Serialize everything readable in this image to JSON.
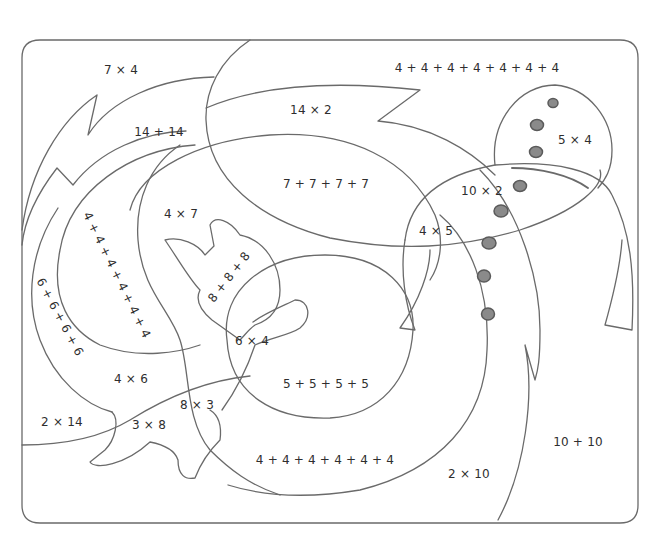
{
  "worksheet": {
    "type": "color-by-number math puzzle",
    "colors": {
      "line": "#6a6a6a",
      "dot_fill": "#8a8a8a",
      "dot_stroke": "#5a5a5a",
      "text": "#2e2e2e",
      "background": "#ffffff"
    },
    "regions": [
      {
        "id": "r1",
        "label": "7 × 4",
        "x": 121,
        "y": 70,
        "rotate": 0
      },
      {
        "id": "r2",
        "label": "4 + 4 + 4 + 4 + 4 + 4 + 4",
        "x": 477,
        "y": 68,
        "rotate": 0
      },
      {
        "id": "r3",
        "label": "14 × 2",
        "x": 311,
        "y": 110,
        "rotate": 0
      },
      {
        "id": "r4",
        "label": "14 + 14",
        "x": 159,
        "y": 132,
        "rotate": 0
      },
      {
        "id": "r5",
        "label": "5 × 4",
        "x": 575,
        "y": 140,
        "rotate": 0
      },
      {
        "id": "r6",
        "label": "7 + 7 + 7 + 7",
        "x": 326,
        "y": 184,
        "rotate": 0
      },
      {
        "id": "r7",
        "label": "10 × 2",
        "x": 482,
        "y": 191,
        "rotate": 0
      },
      {
        "id": "r8",
        "label": "4 × 7",
        "x": 181,
        "y": 214,
        "rotate": 0
      },
      {
        "id": "r9",
        "label": "4 × 5",
        "x": 436,
        "y": 231,
        "rotate": 0
      },
      {
        "id": "r10",
        "label": "4 + 4 + 4 + 4 + 4 + 4",
        "x": 117,
        "y": 275,
        "rotate": 64
      },
      {
        "id": "r11",
        "label": "8 + 8 + 8",
        "x": 229,
        "y": 277,
        "rotate": -52
      },
      {
        "id": "r12",
        "label": "6 + 6 + 6 + 6",
        "x": 60,
        "y": 317,
        "rotate": 62
      },
      {
        "id": "r13",
        "label": "6 × 4",
        "x": 252,
        "y": 341,
        "rotate": 0
      },
      {
        "id": "r14",
        "label": "4 × 6",
        "x": 131,
        "y": 379,
        "rotate": 0
      },
      {
        "id": "r15",
        "label": "5 + 5 + 5 + 5",
        "x": 326,
        "y": 384,
        "rotate": 0
      },
      {
        "id": "r16",
        "label": "8 × 3",
        "x": 197,
        "y": 405,
        "rotate": 0
      },
      {
        "id": "r17",
        "label": "2 × 14",
        "x": 62,
        "y": 422,
        "rotate": 0
      },
      {
        "id": "r18",
        "label": "3 × 8",
        "x": 149,
        "y": 425,
        "rotate": 0
      },
      {
        "id": "r19",
        "label": "10 + 10",
        "x": 578,
        "y": 442,
        "rotate": 0
      },
      {
        "id": "r20",
        "label": "4 + 4 + 4 + 4 + 4 + 4",
        "x": 325,
        "y": 460,
        "rotate": 0
      },
      {
        "id": "r21",
        "label": "2 × 10",
        "x": 469,
        "y": 474,
        "rotate": 0
      }
    ],
    "dots": [
      {
        "cx": 553,
        "cy": 103,
        "rx": 5,
        "ry": 4.5
      },
      {
        "cx": 537,
        "cy": 125,
        "rx": 6.5,
        "ry": 5.5
      },
      {
        "cx": 536,
        "cy": 152,
        "rx": 6.5,
        "ry": 5.5
      },
      {
        "cx": 520,
        "cy": 186,
        "rx": 6.5,
        "ry": 5.5
      },
      {
        "cx": 501,
        "cy": 211,
        "rx": 7,
        "ry": 6
      },
      {
        "cx": 489,
        "cy": 243,
        "rx": 7,
        "ry": 6
      },
      {
        "cx": 484,
        "cy": 276,
        "rx": 6.5,
        "ry": 6
      },
      {
        "cx": 488,
        "cy": 314,
        "rx": 6.5,
        "ry": 6
      }
    ]
  }
}
